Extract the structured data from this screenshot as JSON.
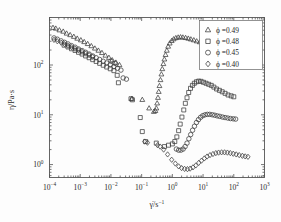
{
  "figure": {
    "background_color": "#fdfdfd",
    "frame_color": "#555555",
    "marker_color": "#3b3b3b"
  },
  "axes": {
    "x": {
      "label": "γ̇/s",
      "label_exponent": "−1",
      "ticks": [
        {
          "mantissa": "10",
          "exponent": "−4",
          "value": -4
        },
        {
          "mantissa": "10",
          "exponent": "−3",
          "value": -3
        },
        {
          "mantissa": "10",
          "exponent": "−2",
          "value": -2
        },
        {
          "mantissa": "10",
          "exponent": "−1",
          "value": -1
        },
        {
          "mantissa": "10",
          "exponent": "0",
          "value": 0
        },
        {
          "mantissa": "10",
          "exponent": "1",
          "value": 1
        },
        {
          "mantissa": "10",
          "exponent": "2",
          "value": 2
        },
        {
          "mantissa": "10",
          "exponent": "3",
          "value": 3
        }
      ]
    },
    "y": {
      "label": "η/Pa·s",
      "ticks": [
        {
          "mantissa": "10",
          "exponent": "2",
          "value": 2
        },
        {
          "mantissa": "10",
          "exponent": "1",
          "value": 1
        },
        {
          "mantissa": "10",
          "exponent": "0",
          "value": 0
        }
      ]
    }
  },
  "legend": {
    "entries": [
      {
        "marker": "triangle",
        "label": "ϕ =0.49"
      },
      {
        "marker": "square",
        "label": "ϕ =0.48"
      },
      {
        "marker": "circle",
        "label": "ϕ =0.45"
      },
      {
        "marker": "diamond",
        "label": "ϕ =0.40"
      }
    ]
  },
  "chart_data": {
    "type": "scatter",
    "title": "",
    "xlabel": "γ̇/s⁻¹",
    "ylabel": "η/Pa·s",
    "xscale": "log",
    "yscale": "log",
    "xlim": [
      0.0001,
      1000
    ],
    "ylim": [
      0.55,
      900
    ],
    "grid": false,
    "legend_position": "top-right",
    "series": [
      {
        "name": "ϕ =0.49",
        "marker": "triangle",
        "points": [
          [
            0.00013,
            560
          ],
          [
            0.00016,
            540
          ],
          [
            0.00021,
            500
          ],
          [
            0.00028,
            470
          ],
          [
            0.00036,
            430
          ],
          [
            0.00047,
            400
          ],
          [
            0.00062,
            370
          ],
          [
            0.0008,
            340
          ],
          [
            0.00105,
            315
          ],
          [
            0.00135,
            290
          ],
          [
            0.00175,
            265
          ],
          [
            0.0023,
            240
          ],
          [
            0.003,
            215
          ],
          [
            0.0039,
            195
          ],
          [
            0.0051,
            175
          ],
          [
            0.0066,
            155
          ],
          [
            0.0086,
            140
          ],
          [
            0.011,
            125
          ],
          [
            0.0145,
            112
          ],
          [
            0.019,
            100
          ],
          [
            0.048,
            21
          ],
          [
            0.105,
            20
          ],
          [
            0.175,
            13.5
          ],
          [
            0.25,
            11.5
          ],
          [
            0.28,
            12.0
          ],
          [
            0.3,
            13.5
          ],
          [
            0.32,
            17
          ],
          [
            0.34,
            22
          ],
          [
            0.36,
            29
          ],
          [
            0.38,
            38
          ],
          [
            0.41,
            50
          ],
          [
            0.44,
            65
          ],
          [
            0.47,
            83
          ],
          [
            0.51,
            105
          ],
          [
            0.55,
            130
          ],
          [
            0.6,
            160
          ],
          [
            0.66,
            195
          ],
          [
            0.73,
            235
          ],
          [
            0.82,
            272
          ],
          [
            0.95,
            305
          ],
          [
            1.1,
            330
          ],
          [
            1.3,
            348
          ],
          [
            1.55,
            358
          ],
          [
            1.85,
            362
          ],
          [
            2.2,
            358
          ],
          [
            2.7,
            350
          ],
          [
            3.3,
            340
          ],
          [
            4.0,
            328
          ],
          [
            5.0,
            315
          ],
          [
            6.2,
            300
          ],
          [
            7.8,
            288
          ],
          [
            10.0,
            275
          ],
          [
            13.0,
            262
          ],
          [
            17.0,
            250
          ],
          [
            22.0,
            240
          ],
          [
            29.0,
            232
          ],
          [
            38.0,
            226
          ]
        ]
      },
      {
        "name": "ϕ =0.48",
        "marker": "square",
        "points": [
          [
            0.0003,
            250
          ],
          [
            0.0004,
            230
          ],
          [
            0.00052,
            212
          ],
          [
            0.00068,
            196
          ],
          [
            0.00088,
            180
          ],
          [
            0.00115,
            166
          ],
          [
            0.0015,
            152
          ],
          [
            0.00195,
            140
          ],
          [
            0.00255,
            128
          ],
          [
            0.0033,
            118
          ],
          [
            0.0043,
            108
          ],
          [
            0.0056,
            99
          ],
          [
            0.0073,
            91
          ],
          [
            0.0095,
            84
          ],
          [
            0.0125,
            77
          ],
          [
            0.016,
            62
          ],
          [
            0.0175,
            44
          ],
          [
            0.045,
            21
          ],
          [
            0.05,
            20
          ],
          [
            0.09,
            8.8
          ],
          [
            0.105,
            4.6
          ],
          [
            0.135,
            2.9
          ],
          [
            0.3,
            2.7
          ],
          [
            0.55,
            2.3
          ],
          [
            0.75,
            2.45
          ],
          [
            1.0,
            2.6
          ],
          [
            1.2,
            2.9
          ],
          [
            1.4,
            3.6
          ],
          [
            1.6,
            4.8
          ],
          [
            1.8,
            6.5
          ],
          [
            2.05,
            9.0
          ],
          [
            2.35,
            12.5
          ],
          [
            2.65,
            17
          ],
          [
            3.0,
            22
          ],
          [
            3.4,
            28
          ],
          [
            3.9,
            34
          ],
          [
            4.5,
            39
          ],
          [
            5.2,
            43
          ],
          [
            6.1,
            46
          ],
          [
            7.2,
            47.5
          ],
          [
            8.6,
            47
          ],
          [
            10.3,
            45
          ],
          [
            12.5,
            43
          ],
          [
            15.2,
            41
          ],
          [
            18.5,
            39
          ],
          [
            22.5,
            36
          ],
          [
            27.5,
            33
          ],
          [
            34.0,
            31
          ],
          [
            42.0,
            29
          ],
          [
            52.0,
            27
          ],
          [
            65.0,
            25
          ],
          [
            82.0,
            24
          ],
          [
            100.0,
            23
          ]
        ]
      },
      {
        "name": "ϕ =0.45",
        "marker": "circle",
        "points": [
          [
            0.00014,
            350
          ],
          [
            0.00018,
            330
          ],
          [
            0.00024,
            305
          ],
          [
            0.00031,
            285
          ],
          [
            0.0004,
            265
          ],
          [
            0.00052,
            245
          ],
          [
            0.00068,
            228
          ],
          [
            0.00088,
            210
          ],
          [
            0.00115,
            195
          ],
          [
            0.0015,
            180
          ],
          [
            0.00195,
            166
          ],
          [
            0.00255,
            152
          ],
          [
            0.0033,
            140
          ],
          [
            0.0043,
            129
          ],
          [
            0.0056,
            119
          ],
          [
            0.0073,
            110
          ],
          [
            0.0095,
            101
          ],
          [
            0.0125,
            93
          ],
          [
            0.0163,
            86
          ],
          [
            0.0212,
            79
          ],
          [
            0.01,
            120
          ],
          [
            0.0135,
            108
          ],
          [
            0.025,
            55
          ],
          [
            0.032,
            52
          ],
          [
            1.35,
            2.05
          ],
          [
            1.6,
            1.95
          ],
          [
            1.9,
            1.95
          ],
          [
            2.25,
            2.05
          ],
          [
            2.6,
            2.3
          ],
          [
            3.0,
            2.7
          ],
          [
            3.45,
            3.3
          ],
          [
            3.95,
            4.0
          ],
          [
            4.55,
            4.9
          ],
          [
            5.25,
            5.9
          ],
          [
            6.1,
            7.0
          ],
          [
            7.1,
            8.0
          ],
          [
            8.3,
            8.9
          ],
          [
            9.8,
            9.6
          ],
          [
            11.6,
            10.0
          ],
          [
            13.8,
            10.2
          ],
          [
            16.5,
            10.2
          ],
          [
            20.0,
            10.0
          ],
          [
            24.0,
            9.8
          ],
          [
            29.0,
            9.5
          ],
          [
            35.0,
            9.3
          ],
          [
            43.0,
            9.0
          ],
          [
            52.0,
            8.8
          ],
          [
            64.0,
            8.6
          ],
          [
            78.0,
            8.4
          ],
          [
            96.0,
            8.3
          ],
          [
            115.0,
            8.2
          ]
        ]
      },
      {
        "name": "ϕ =0.40",
        "marker": "diamond",
        "points": [
          [
            0.00014,
            320
          ],
          [
            0.00018,
            300
          ],
          [
            0.00024,
            280
          ],
          [
            0.00031,
            262
          ],
          [
            0.0004,
            244
          ],
          [
            0.00052,
            228
          ],
          [
            0.00068,
            212
          ],
          [
            0.00088,
            198
          ],
          [
            0.00115,
            184
          ],
          [
            0.0015,
            170
          ],
          [
            0.00195,
            158
          ],
          [
            0.00255,
            146
          ],
          [
            0.125,
            2.9
          ],
          [
            0.155,
            2.75
          ],
          [
            0.33,
            2.45
          ],
          [
            0.4,
            2.3
          ],
          [
            0.52,
            2.0
          ],
          [
            0.7,
            1.6
          ],
          [
            0.95,
            1.25
          ],
          [
            1.25,
            1.05
          ],
          [
            1.6,
            0.92
          ],
          [
            2.0,
            0.85
          ],
          [
            2.5,
            0.82
          ],
          [
            3.1,
            0.81
          ],
          [
            3.8,
            0.83
          ],
          [
            4.7,
            0.88
          ],
          [
            5.8,
            0.96
          ],
          [
            7.2,
            1.08
          ],
          [
            8.9,
            1.2
          ],
          [
            11.0,
            1.33
          ],
          [
            13.5,
            1.45
          ],
          [
            16.8,
            1.55
          ],
          [
            21.0,
            1.63
          ],
          [
            26.0,
            1.7
          ],
          [
            32.0,
            1.74
          ],
          [
            40.0,
            1.76
          ],
          [
            50.0,
            1.76
          ],
          [
            62.0,
            1.74
          ],
          [
            77.0,
            1.7
          ],
          [
            96.0,
            1.65
          ],
          [
            120.0,
            1.6
          ],
          [
            150.0,
            1.55
          ],
          [
            190.0,
            1.5
          ],
          [
            235.0,
            1.46
          ],
          [
            290.0,
            1.43
          ]
        ]
      }
    ]
  }
}
